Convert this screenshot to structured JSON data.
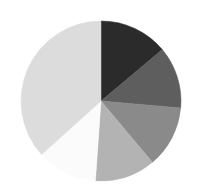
{
  "chart_data": {
    "type": "pie",
    "title": "",
    "subtitle": "",
    "xlabel": "",
    "ylabel": "",
    "grid": false,
    "legend": "none",
    "start_angle_deg": 0,
    "direction": "clockwise",
    "center": {
      "x": 101,
      "y": 101
    },
    "radius": 80,
    "background_color": "#ffffff",
    "labels": [
      "Slice 1",
      "Slice 2",
      "Slice 3",
      "Slice 4",
      "Slice 5",
      "Slice 6"
    ],
    "values": [
      13.9,
      12.5,
      12.5,
      12.2,
      12.2,
      36.7
    ],
    "angles_deg": [
      50,
      45,
      45,
      44,
      44,
      132
    ],
    "colors": [
      "#2b2b2b",
      "#5e5e5e",
      "#8a8a8a",
      "#b3b3b3",
      "#fbfbfb",
      "#dcdcdc"
    ],
    "slices": [
      {
        "label": "Slice 1",
        "value": 13.9,
        "color": "#2b2b2b",
        "start_deg": 0,
        "end_deg": 50
      },
      {
        "label": "Slice 2",
        "value": 12.5,
        "color": "#5e5e5e",
        "start_deg": 50,
        "end_deg": 95
      },
      {
        "label": "Slice 3",
        "value": 12.5,
        "color": "#8a8a8a",
        "start_deg": 95,
        "end_deg": 140
      },
      {
        "label": "Slice 4",
        "value": 12.2,
        "color": "#b3b3b3",
        "start_deg": 140,
        "end_deg": 184
      },
      {
        "label": "Slice 5",
        "value": 12.2,
        "color": "#fbfbfb",
        "start_deg": 184,
        "end_deg": 228
      },
      {
        "label": "Slice 6",
        "value": 36.7,
        "color": "#dcdcdc",
        "start_deg": 228,
        "end_deg": 360
      }
    ]
  }
}
